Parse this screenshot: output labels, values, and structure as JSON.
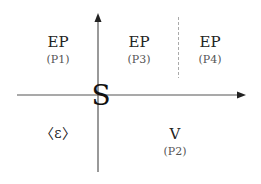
{
  "diagram": {
    "type": "quadrant-axes",
    "axes": {
      "horizontal_arrow": "right",
      "vertical_arrow": "up",
      "origin_label": "S"
    },
    "divider": {
      "style": "dashed",
      "between": [
        "P3",
        "P4"
      ]
    },
    "regions": [
      {
        "id": "P1",
        "title": "EP",
        "subtitle": "(P1)",
        "quadrant": "top-left"
      },
      {
        "id": "P3",
        "title": "EP",
        "subtitle": "(P3)",
        "quadrant": "top-right-left"
      },
      {
        "id": "P4",
        "title": "EP",
        "subtitle": "(P4)",
        "quadrant": "top-right-right"
      },
      {
        "id": "epsilon",
        "title": "〈ε〉",
        "quadrant": "bottom-left"
      },
      {
        "id": "P2",
        "title": "V",
        "subtitle": "(P2)",
        "quadrant": "bottom-right"
      }
    ],
    "colors": {
      "axis": "#555555",
      "divider": "#aaaaaa",
      "text": "#222222"
    }
  }
}
